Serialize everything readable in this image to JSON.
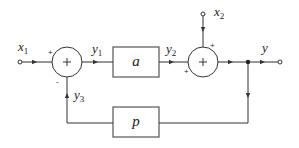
{
  "diagram": {
    "type": "feedback-block-diagram",
    "signals": {
      "x1": {
        "base": "x",
        "sub": "1"
      },
      "x2": {
        "base": "x",
        "sub": "2"
      },
      "y1": {
        "base": "y",
        "sub": "1"
      },
      "y2": {
        "base": "y",
        "sub": "2"
      },
      "y3": {
        "base": "y",
        "sub": "3"
      },
      "y": {
        "base": "y",
        "sub": ""
      }
    },
    "blocks": {
      "forward": {
        "label": "a"
      },
      "feedback": {
        "label": "p"
      }
    },
    "summers": {
      "s1": {
        "symbol": "+",
        "input_main_sign": "+",
        "input_feedback_sign": "-"
      },
      "s2": {
        "symbol": "+",
        "input_main_sign": "+",
        "input_x2_sign": "+"
      }
    },
    "colors": {
      "line": "#333333",
      "background": "#ffffff"
    }
  }
}
